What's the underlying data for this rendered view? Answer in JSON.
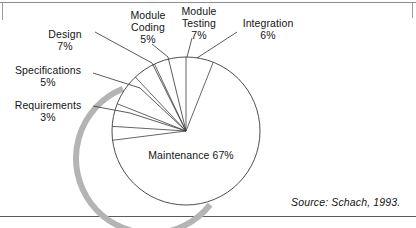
{
  "figure": {
    "source_note": "Source: Schach, 1993.",
    "background_color": "#ffffff",
    "outline_color": "#3a3a3a",
    "shadow_color": "#b4b4b4"
  },
  "chart_data": {
    "type": "pie",
    "title": "",
    "subtitle": "",
    "xlabel": "",
    "ylabel": "",
    "legend_position": "none",
    "grid": false,
    "unit": "%",
    "center": {
      "x": 186,
      "y": 131
    },
    "radius": 74,
    "start_angle_deg": 90,
    "direction": "counterclockwise",
    "categories": [
      "Module Testing",
      "Module Coding",
      "Design",
      "Specifications",
      "Requirements",
      "Maintenance",
      "Integration"
    ],
    "values": [
      7,
      5,
      7,
      5,
      3,
      67,
      6
    ],
    "slices": [
      {
        "label": "Module Testing",
        "percent": 7,
        "pct_text": "7%",
        "label_line1": "Module",
        "label_line2": "Testing"
      },
      {
        "label": "Module Coding",
        "percent": 5,
        "pct_text": "5%",
        "label_line1": "Module",
        "label_line2": "Coding"
      },
      {
        "label": "Design",
        "percent": 7,
        "pct_text": "7%",
        "label_line1": "Design",
        "label_line2": ""
      },
      {
        "label": "Specifications",
        "percent": 5,
        "pct_text": "5%",
        "label_line1": "Specifications",
        "label_line2": ""
      },
      {
        "label": "Requirements",
        "percent": 3,
        "pct_text": "3%",
        "label_line1": "Requirements",
        "label_line2": ""
      },
      {
        "label": "Maintenance",
        "percent": 67,
        "pct_text": "67%",
        "label_line1": "Maintenance 67%",
        "label_line2": ""
      },
      {
        "label": "Integration",
        "percent": 6,
        "pct_text": "6%",
        "label_line1": "Integration",
        "label_line2": ""
      }
    ]
  },
  "labels": {
    "design": {
      "name": "Design",
      "percent": "7%"
    },
    "specs": {
      "name": "Specifications",
      "percent": "5%"
    },
    "reqs": {
      "name": "Requirements",
      "percent": "3%"
    },
    "coding_l1": "Module",
    "coding_l2": "Coding",
    "coding_pct": "5%",
    "testing_l1": "Module",
    "testing_l2": "Testing",
    "testing_pct": "7%",
    "integration": {
      "name": "Integration",
      "percent": "6%"
    },
    "maintenance": "Maintenance 67%"
  }
}
